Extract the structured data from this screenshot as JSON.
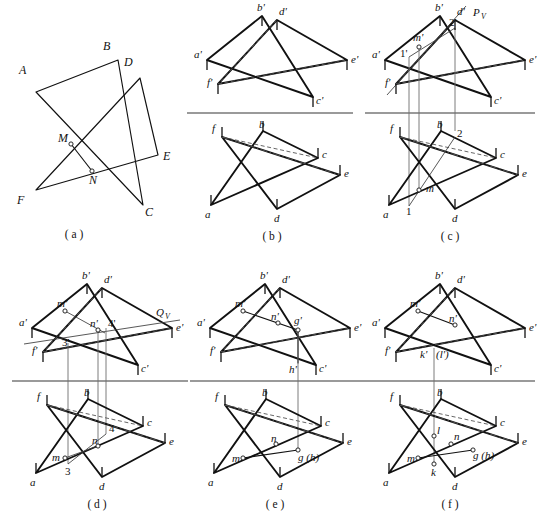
{
  "figure": {
    "panel_captions": [
      "( a )",
      "( b )",
      "( c )",
      "( d )",
      "( e )",
      "( f )"
    ]
  },
  "panels": {
    "a": {
      "caption": "( a )",
      "kind": "pictorial",
      "labels": [
        {
          "id": "A",
          "text": "A",
          "x": 22,
          "y": 70
        },
        {
          "id": "B",
          "text": "B",
          "x": 104,
          "y": 47
        },
        {
          "id": "C",
          "text": "C",
          "x": 124,
          "y": 211
        },
        {
          "id": "D",
          "text": "D",
          "x": 124,
          "y": 61
        },
        {
          "id": "E",
          "text": "E",
          "x": 147,
          "y": 141
        },
        {
          "id": "F",
          "text": "F",
          "x": 15,
          "y": 200
        },
        {
          "id": "M",
          "text": "M",
          "x": 60,
          "y": 141
        },
        {
          "id": "N",
          "text": "N",
          "x": 90,
          "y": 175
        }
      ]
    },
    "b": {
      "caption": "( b )",
      "kind": "two-view-projection",
      "labels_top": [
        "b'",
        "d'",
        "a'",
        "e'",
        "f'",
        "c'"
      ],
      "labels_bottom": [
        "b",
        "c",
        "e",
        "d",
        "a",
        "f"
      ]
    },
    "c": {
      "caption": "( c )",
      "kind": "two-view-projection",
      "labels_top": [
        "b'",
        "d'",
        "Pᵥ",
        "2'",
        "m'",
        "1'",
        "a'",
        "e'",
        "f'",
        "c'"
      ],
      "labels_bottom": [
        "b",
        "2",
        "m",
        "1",
        "c",
        "e",
        "d",
        "a",
        "f"
      ],
      "aux_plane_label": "P",
      "aux_plane_sub": "V"
    },
    "d": {
      "caption": "( d )",
      "kind": "two-view-projection",
      "labels_top": [
        "b'",
        "d'",
        "m'",
        "n'",
        "4'",
        "Qᵥ",
        "a'",
        "e'",
        "3'",
        "f'",
        "c'"
      ],
      "labels_bottom": [
        "b",
        "n",
        "4",
        "m",
        "3",
        "c",
        "e",
        "d",
        "a",
        "f"
      ],
      "aux_plane_label": "Q",
      "aux_plane_sub": "V"
    },
    "e": {
      "caption": "( e )",
      "kind": "two-view-projection",
      "labels_top": [
        "b'",
        "d'",
        "m'",
        "n'",
        "g'",
        "h'",
        "a'",
        "e'",
        "f'",
        "c'"
      ],
      "labels_bottom": [
        "b",
        "n",
        "m",
        "g (h)",
        "c",
        "e",
        "d",
        "a",
        "f"
      ]
    },
    "f": {
      "caption": "( f )",
      "kind": "two-view-projection",
      "labels_top": [
        "b'",
        "d'",
        "m'",
        "n'",
        "k'",
        "(l')",
        "a'",
        "e'",
        "f'",
        "c'"
      ],
      "labels_bottom": [
        "b",
        "l",
        "n",
        "m",
        "g (h)",
        "k",
        "c",
        "e",
        "d",
        "a",
        "f"
      ]
    }
  }
}
